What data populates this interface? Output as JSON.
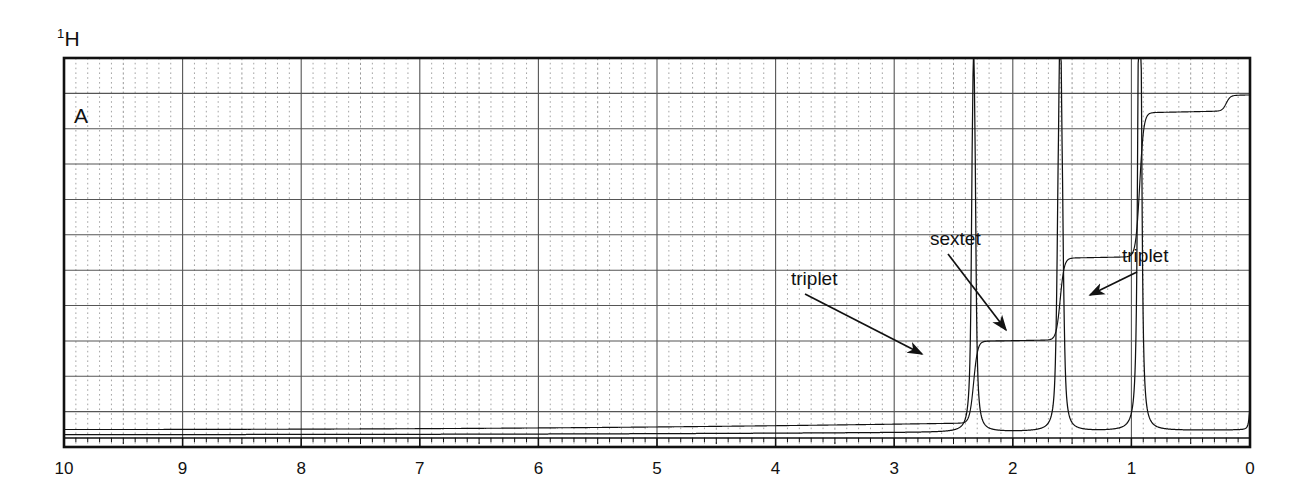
{
  "figure": {
    "nucleus_label": "1H",
    "nucleus_superscript": "1",
    "nucleus_element": "H",
    "panel_label": "A",
    "annotations": [
      {
        "id": "triplet-left",
        "text": "triplet",
        "points_to_ppm": 2.33
      },
      {
        "id": "sextet",
        "text": "sextet",
        "points_to_ppm": 1.6
      },
      {
        "id": "triplet-right",
        "text": "triplet",
        "points_to_ppm": 0.93
      }
    ]
  },
  "chart_data": {
    "type": "line",
    "title": "1H",
    "xlabel": "",
    "ylabel": "",
    "xlim": [
      10,
      0
    ],
    "ylim": [
      0,
      1
    ],
    "x_axis_inverted": true,
    "grid": true,
    "grid_major_step_ppm": 0.5,
    "grid_minor_step_ppm": 0.1,
    "grid_horizontal_divisions": 11,
    "tick_labels": [
      "10",
      "9",
      "8",
      "7",
      "6",
      "5",
      "4",
      "3",
      "2",
      "1",
      "0"
    ],
    "tick_values": [
      10,
      9,
      8,
      7,
      6,
      5,
      4,
      3,
      2,
      1,
      0
    ],
    "legend_position": "none",
    "series": [
      {
        "name": "spectrum",
        "peaks": [
          {
            "ppm": 2.33,
            "height": 0.74,
            "multiplicity": "triplet",
            "lines": 3,
            "j_ppm": 0.013,
            "assignment": "CH2 alpha"
          },
          {
            "ppm": 1.6,
            "height": 0.58,
            "multiplicity": "sextet",
            "lines": 6,
            "j_ppm": 0.013,
            "assignment": "CH2 beta"
          },
          {
            "ppm": 0.93,
            "height": 0.98,
            "multiplicity": "triplet",
            "lines": 3,
            "j_ppm": 0.013,
            "assignment": "CH3"
          },
          {
            "ppm": 0.0,
            "height": 0.05,
            "multiplicity": "singlet",
            "lines": 1,
            "j_ppm": 0.0,
            "assignment": "TMS"
          }
        ]
      },
      {
        "name": "integration",
        "steps": [
          {
            "ppm": 2.33,
            "rise": 0.21
          },
          {
            "ppm": 1.6,
            "rise": 0.21
          },
          {
            "ppm": 0.93,
            "rise": 0.37
          },
          {
            "ppm": 0.2,
            "rise": 0.04
          }
        ],
        "baseline": 0.045
      }
    ]
  },
  "axis": {
    "labels": [
      {
        "value": "10",
        "ppm": 10
      },
      {
        "value": "9",
        "ppm": 9
      },
      {
        "value": "8",
        "ppm": 8
      },
      {
        "value": "7",
        "ppm": 7
      },
      {
        "value": "6",
        "ppm": 6
      },
      {
        "value": "5",
        "ppm": 5
      },
      {
        "value": "4",
        "ppm": 4
      },
      {
        "value": "3",
        "ppm": 3
      },
      {
        "value": "2",
        "ppm": 2
      },
      {
        "value": "1",
        "ppm": 1
      },
      {
        "value": "0",
        "ppm": 0
      }
    ]
  },
  "colors": {
    "ink": "#111111",
    "grid_major": "#555555",
    "grid_minor": "#9a9a9a",
    "paper": "#ffffff"
  }
}
